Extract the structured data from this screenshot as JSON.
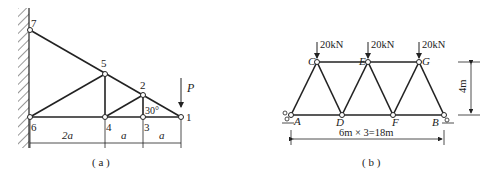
{
  "figure_a": {
    "caption": "( a )",
    "nodes": {
      "n1": "1",
      "n2": "2",
      "n3": "3",
      "n4": "4",
      "n5": "5",
      "n6": "6",
      "n7": "7"
    },
    "load": "P",
    "angle": "30°",
    "dims": {
      "d1": "2a",
      "d2": "a",
      "d3": "a"
    }
  },
  "figure_b": {
    "caption": "( b )",
    "nodes": {
      "A": "A",
      "B": "B",
      "C": "C",
      "D": "D",
      "E": "E",
      "F": "F",
      "G": "G"
    },
    "loads": [
      "20kN",
      "20kN",
      "20kN"
    ],
    "height_dim": "4m",
    "span_dim": "6m × 3=18m"
  }
}
